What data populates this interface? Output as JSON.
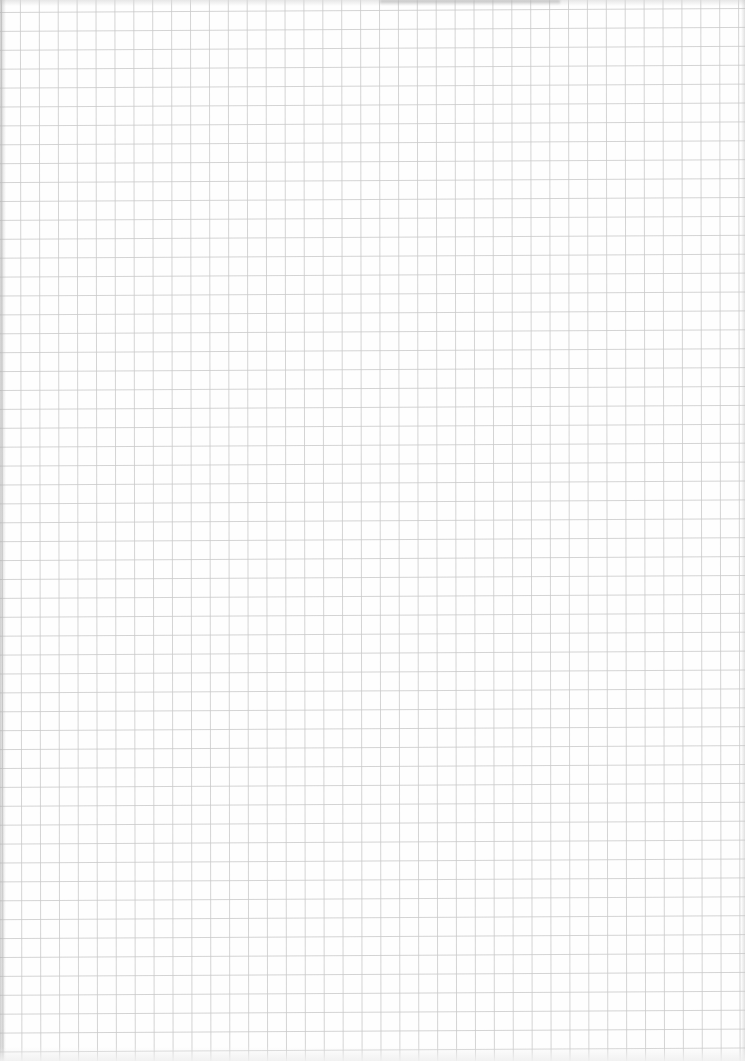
{
  "document": {
    "type": "graph-paper-sheet",
    "text_content": ""
  },
  "grid": {
    "cell_size_px": 18.9,
    "offset_x_px": 1.5,
    "offset_y_px": 10.5,
    "columns": 40,
    "rows": 56,
    "line_color": "#c9c9c9",
    "line_width_px": 0.8,
    "paper_color": "#fefefe"
  },
  "colors": {
    "paper": "#fefefe",
    "grid_line": "#c9c9c9",
    "edge_shadow": "#a8a8a8"
  }
}
